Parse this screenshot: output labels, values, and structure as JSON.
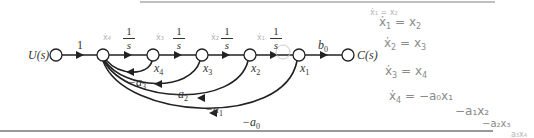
{
  "diagram": {
    "type": "signal-flow-graph",
    "input_label": "U(s)",
    "output_label": "C(s)",
    "nodes": [
      {
        "id": "U",
        "label": "U(s)"
      },
      {
        "id": "sum",
        "label": ""
      },
      {
        "id": "x4",
        "label": "x",
        "sub": "4"
      },
      {
        "id": "x3",
        "label": "x",
        "sub": "3"
      },
      {
        "id": "x2",
        "label": "x",
        "sub": "2"
      },
      {
        "id": "x1",
        "label": "x",
        "sub": "1"
      },
      {
        "id": "C",
        "label": "C(s)"
      }
    ],
    "forward_branches": [
      {
        "from": "U",
        "to": "sum",
        "gain": "1"
      },
      {
        "from": "sum",
        "to": "x4",
        "gain_num": "1",
        "gain_den": "s"
      },
      {
        "from": "x4",
        "to": "x3",
        "gain_num": "1",
        "gain_den": "s"
      },
      {
        "from": "x3",
        "to": "x2",
        "gain_num": "1",
        "gain_den": "s"
      },
      {
        "from": "x2",
        "to": "x1",
        "gain_num": "1",
        "gain_den": "s"
      },
      {
        "from": "x1",
        "to": "C",
        "gain": "b",
        "gain_sub": "0"
      }
    ],
    "feedback_branches": [
      {
        "from": "x4",
        "to": "sum",
        "gain": "−a",
        "gain_sub": "3"
      },
      {
        "from": "x3",
        "to": "sum",
        "gain": "−a",
        "gain_sub": "2"
      },
      {
        "from": "x2",
        "to": "sum",
        "gain": "−a",
        "gain_sub": "1"
      },
      {
        "from": "x1",
        "to": "sum",
        "gain": "−a",
        "gain_sub": "0"
      }
    ],
    "handwritten_annotations": {
      "above_branches": [
        "ẋ₄",
        "ẋ₃",
        "ẋ₂",
        "ẋ₁"
      ],
      "eq1": {
        "lhs": "ẋ",
        "lhs_sub": "1",
        "rhs": "= x",
        "rhs_sub": "2"
      },
      "eq2": {
        "lhs": "ẋ",
        "lhs_sub": "2",
        "rhs": "= x",
        "rhs_sub": "3"
      },
      "eq3": {
        "lhs": "ẋ",
        "lhs_sub": "3",
        "rhs": "= x",
        "rhs_sub": "4"
      },
      "eq4": {
        "lhs": "ẋ",
        "lhs_sub": "4",
        "rhs": "= −a₀x₁"
      },
      "eq4_line2": "−a₁x₂",
      "eq4_line3": "−a₂x₃",
      "eq4_line4": "a₃x₄",
      "top_scribble": "ẋ₁ = x₂"
    }
  }
}
